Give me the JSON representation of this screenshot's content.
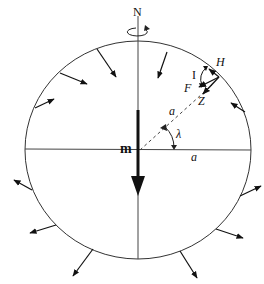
{
  "diagram": {
    "labels": {
      "north": "N",
      "moment": "m",
      "radius_inner": "a",
      "radius_axis": "a",
      "latitude": "λ",
      "horizontal": "H",
      "inclination": "I",
      "total_field": "F",
      "vertical": "Z"
    },
    "colors": {
      "stroke": "#111111",
      "background": "#ffffff"
    },
    "sphere": {
      "cx": 138,
      "cy": 150,
      "rx": 113,
      "ry": 109
    }
  }
}
